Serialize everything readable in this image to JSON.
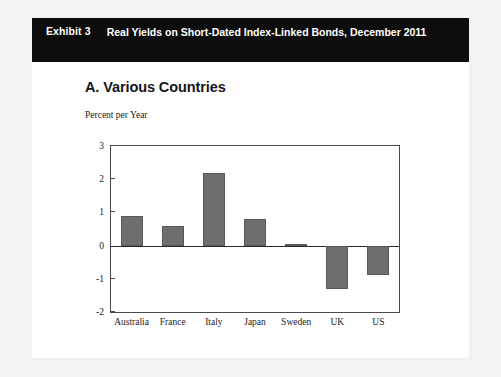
{
  "exhibit": {
    "label": "Exhibit 3",
    "title": "Real Yields on Short-Dated Index-Linked Bonds, December 2011"
  },
  "panel": {
    "title": "A. Various Countries",
    "unit_label": "Percent per Year"
  },
  "colors": {
    "header_bar": "#0d0d0d",
    "header_text": "#ffffff",
    "bar_fill": "#6e6e6e",
    "bar_stroke": "#585858",
    "axis": "#4a4a4a",
    "page_background": "#f2f2f0",
    "card_background": "#ffffff"
  },
  "chart_data": {
    "type": "bar",
    "title": "A. Various Countries",
    "subtitle": "Real Yields on Short-Dated Index-Linked Bonds, December 2011",
    "xlabel": "",
    "ylabel": "Percent per Year",
    "categories": [
      "Australia",
      "France",
      "Italy",
      "Japan",
      "Sweden",
      "UK",
      "US"
    ],
    "values": [
      0.9,
      0.6,
      2.2,
      0.8,
      0.05,
      -1.3,
      -0.9
    ],
    "ylim": [
      -2,
      3
    ],
    "yticks": [
      3,
      2,
      1,
      0,
      -1,
      -2
    ],
    "ytick_labels": [
      "3",
      "2",
      "1",
      "0",
      "-1",
      "-2"
    ],
    "grid": false,
    "legend": "none",
    "zero_line": true,
    "series": [
      {
        "name": "Real yield (percent per year)",
        "values": [
          0.9,
          0.6,
          2.2,
          0.8,
          0.05,
          -1.3,
          -0.9
        ]
      }
    ]
  }
}
